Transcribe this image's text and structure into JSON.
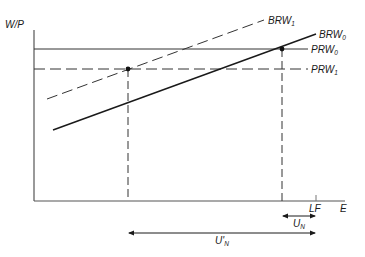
{
  "diagram": {
    "y_axis_label": "W/P",
    "x_axis_label": "E",
    "lf_label": "LF",
    "curves": [
      {
        "name": "BRW",
        "sub": "1",
        "style": "dashed",
        "from": [
          47,
          99
        ],
        "to": [
          264,
          20
        ]
      },
      {
        "name": "BRW",
        "sub": "0",
        "style": "solid",
        "from": [
          53,
          130
        ],
        "to": [
          316,
          34
        ]
      },
      {
        "name": "PRW",
        "sub": "0",
        "style": "solid",
        "y": 49
      },
      {
        "name": "PRW",
        "sub": "1",
        "style": "dashed",
        "y": 69
      }
    ],
    "points": [
      {
        "x": 128,
        "y": 69
      },
      {
        "x": 282,
        "y": 49
      }
    ],
    "ranges": [
      {
        "name": "U",
        "sub": "N",
        "prime": false,
        "from": 282,
        "to": 316
      },
      {
        "name": "U",
        "sub": "N",
        "prime": true,
        "from": 128,
        "to": 316
      }
    ],
    "labels": {
      "brw1": "BRW",
      "brw1_sub": "1",
      "brw0": "BRW",
      "brw0_sub": "0",
      "prw0": "PRW",
      "prw0_sub": "0",
      "prw1": "PRW",
      "prw1_sub": "1",
      "un": "U",
      "un_sub": "N",
      "unp": "U'",
      "unp_sub": "N"
    }
  }
}
